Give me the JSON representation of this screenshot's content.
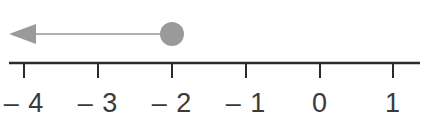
{
  "figure": {
    "width": 426,
    "height": 131,
    "background_color": "#ffffff"
  },
  "chart_data": {
    "type": "line",
    "title": "",
    "xlabel": "",
    "ylabel": "",
    "subtitle": "",
    "orientation": "horizontal",
    "grid": false,
    "legend": null,
    "xlim": [
      -4.2,
      1.37
    ],
    "axis": {
      "line_color": "#2b2b2b",
      "line_width": 2.5,
      "y_position": 63,
      "x_start": 9,
      "x_end": 420,
      "tick_length": 15,
      "tick_color": "#2b2b2b",
      "tick_width": 2
    },
    "ticks": [
      {
        "value": -4,
        "label": "– 4",
        "x": 24
      },
      {
        "value": -3,
        "label": "– 3",
        "x": 98
      },
      {
        "value": -2,
        "label": "– 2",
        "x": 172
      },
      {
        "value": -1,
        "label": "– 1",
        "x": 246
      },
      {
        "value": 0,
        "label": "0",
        "x": 320
      },
      {
        "value": 1,
        "label": "1",
        "x": 393
      }
    ],
    "tick_labels": [
      "– 4",
      "– 3",
      "– 2",
      "– 1",
      "0",
      "1"
    ],
    "tick_label_y": 112,
    "tick_label_color": "#3a3a3a",
    "tick_label_size": 27,
    "ray": {
      "endpoint_value": -2,
      "endpoint_x": 172,
      "endpoint_type": "closed-circle",
      "inclusive": true,
      "direction": "left",
      "relation": "x ≤ -2",
      "color": "#9a9a9a",
      "shaft_color": "#b0b0b0",
      "shaft_width": 2,
      "dot_radius": 12,
      "dot_center_y": 34,
      "arrow_tip_x": 9,
      "arrow_base_x": 36,
      "arrow_half_height": 10
    }
  }
}
